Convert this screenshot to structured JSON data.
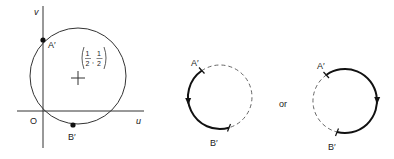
{
  "figure": {
    "left_panel": {
      "axis_labels": {
        "u": "u",
        "v": "v",
        "origin": "O"
      },
      "points": [
        {
          "name": "A'",
          "label": "A′",
          "position": "on v-axis, upper intersection"
        },
        {
          "name": "B'",
          "label": "B′",
          "position": "bottom of circle"
        }
      ],
      "center_label": {
        "x_num": "1",
        "x_den": "2",
        "y_num": "1",
        "y_den": "2"
      }
    },
    "middle_panel": {
      "labels": {
        "a": "A′",
        "b": "B′"
      },
      "direction": "counterclockwise (left arc, solid, arrow down)"
    },
    "separator": "or",
    "right_panel": {
      "labels": {
        "a": "A′",
        "b": "B′"
      },
      "direction": "clockwise (right arc, solid, arrow down)"
    }
  }
}
